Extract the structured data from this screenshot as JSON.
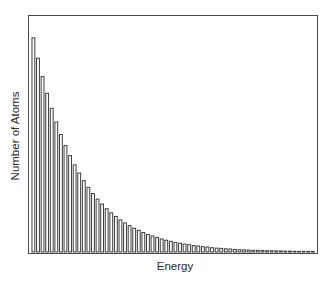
{
  "chart_data": {
    "type": "bar",
    "title": "",
    "xlabel": "Energy",
    "ylabel": "Number of Atoms",
    "grid": false,
    "legend": null,
    "axis_ticks": "none",
    "bar_count": 62,
    "decay_ratio": 0.905,
    "ylim": [
      0,
      110
    ],
    "categories": [
      1,
      2,
      3,
      4,
      5,
      6,
      7,
      8,
      9,
      10,
      11,
      12,
      13,
      14,
      15,
      16,
      17,
      18,
      19,
      20,
      21,
      22,
      23,
      24,
      25,
      26,
      27,
      28,
      29,
      30,
      31,
      32,
      33,
      34,
      35,
      36,
      37,
      38,
      39,
      40,
      41,
      42,
      43,
      44,
      45,
      46,
      47,
      48,
      49,
      50,
      51,
      52,
      53,
      54,
      55,
      56,
      57,
      58,
      59,
      60,
      61,
      62
    ],
    "values": [
      100.0,
      90.5,
      81.9,
      74.1,
      67.1,
      60.7,
      54.9,
      49.7,
      45.0,
      40.7,
      36.9,
      33.3,
      30.2,
      27.3,
      24.7,
      22.4,
      20.2,
      18.3,
      16.6,
      15.0,
      13.6,
      12.3,
      11.1,
      10.1,
      9.1,
      8.2,
      7.5,
      6.8,
      6.1,
      5.5,
      5.0,
      4.5,
      4.1,
      3.7,
      3.4,
      3.0,
      2.8,
      2.5,
      2.3,
      2.0,
      1.8,
      1.7,
      1.5,
      1.4,
      1.2,
      1.1,
      1.0,
      0.9,
      0.8,
      0.8,
      0.7,
      0.6,
      0.6,
      0.5,
      0.5,
      0.4,
      0.4,
      0.3,
      0.3,
      0.3,
      0.3,
      0.2
    ]
  },
  "colors": {
    "bar_stroke": "#3a3a3a",
    "bar_fill": "#ffffff",
    "frame": "#4a4a4a",
    "text": "#2a2a2a"
  }
}
